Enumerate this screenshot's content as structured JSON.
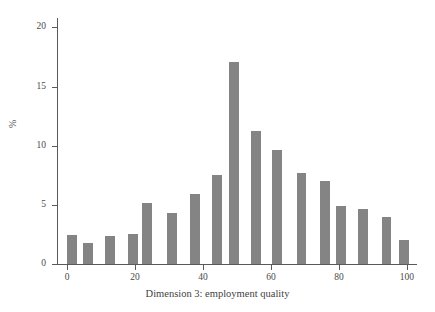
{
  "chart_data": {
    "type": "bar",
    "title": "",
    "xlabel": "Dimension 3: employment quality",
    "ylabel": "%",
    "xlim": [
      -3,
      103
    ],
    "ylim": [
      0,
      20.8
    ],
    "grid": false,
    "legend": null,
    "bar_color": "#848484",
    "axis_color": "#5a5a5a",
    "x_ticks": [
      0,
      20,
      40,
      60,
      80,
      100
    ],
    "x_tick_labels": [
      "0",
      "20",
      "40",
      "60",
      "80",
      "100"
    ],
    "y_ticks": [
      0,
      5,
      10,
      15,
      20
    ],
    "y_tick_labels": [
      "0",
      "5",
      "10",
      "15",
      "20"
    ],
    "x": [
      1.5,
      6.2,
      12.6,
      19.5,
      23.6,
      30.8,
      37.6,
      44.1,
      49.2,
      55.6,
      61.8,
      69.0,
      75.8,
      80.6,
      87.1,
      94.0,
      99.2
    ],
    "values": [
      2.45,
      1.75,
      2.35,
      2.5,
      5.15,
      4.3,
      5.95,
      7.55,
      17.05,
      11.25,
      9.65,
      7.7,
      7.05,
      4.9,
      4.65,
      3.95,
      2.05
    ],
    "bar_width": 2.9
  },
  "figure": {
    "background": "#ffffff"
  }
}
